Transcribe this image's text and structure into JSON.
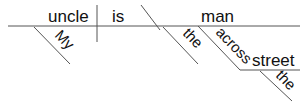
{
  "diagram": {
    "type": "Reed-Kellogg sentence diagram",
    "sentence_words": {
      "subject": "uncle",
      "verb": "is",
      "complement": "man",
      "subject_modifier": "My",
      "complement_modifier": "the",
      "preposition": "across",
      "object_of_preposition": "street",
      "object_modifier": "the"
    },
    "colors": {
      "line": "#555555",
      "text": "#111111",
      "background": "#ffffff"
    }
  }
}
